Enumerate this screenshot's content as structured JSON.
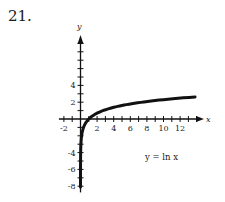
{
  "problem_number": "21.",
  "chart_data": {
    "type": "line",
    "title": "",
    "annotation": "y = ln x",
    "xlabel": "x",
    "ylabel": "y",
    "x_tick_labels": [
      "-2",
      "2",
      "4",
      "6",
      "8",
      "10",
      "12"
    ],
    "y_tick_labels": [
      "4",
      "2",
      "-4",
      "-6",
      "-8"
    ],
    "xlim": [
      -2.5,
      14.5
    ],
    "ylim": [
      -8.5,
      9.5
    ],
    "grid": false,
    "legend": null,
    "series": [
      {
        "name": "y = ln x",
        "function": "ln(x)",
        "x": [
          0.0003,
          0.001,
          0.01,
          0.05,
          0.1,
          0.25,
          0.5,
          1,
          2,
          3,
          4,
          6,
          8,
          10,
          12,
          14
        ],
        "y": [
          -8.1,
          -6.91,
          -4.61,
          -3.0,
          -2.3,
          -1.39,
          -0.69,
          0,
          0.69,
          1.1,
          1.39,
          1.79,
          2.08,
          2.3,
          2.48,
          2.64
        ]
      }
    ]
  }
}
